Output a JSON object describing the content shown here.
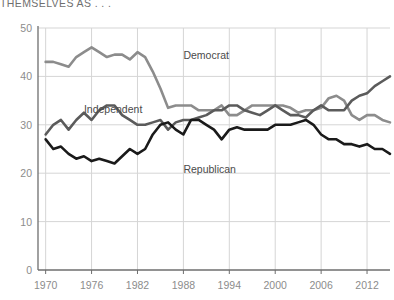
{
  "headline": {
    "text": "THEMSELVES AS . . ."
  },
  "colors": {
    "democrat": "#8c8c8c",
    "independent": "#5b5b5b",
    "republican": "#1a1a1a",
    "grid": "#d5d5d5",
    "axis": "#6e6e6e",
    "tick_text": "#8c8c8c",
    "label_text": "#4a4a4a",
    "headline_text": "#6f6f6f",
    "background": "#ffffff"
  },
  "chart_data": {
    "type": "line",
    "title": "THEMSELVES AS . . .",
    "xlabel": "",
    "ylabel": "",
    "xlim": [
      1969,
      2015
    ],
    "ylim": [
      0,
      50
    ],
    "ytick_values": [
      0,
      10,
      20,
      30,
      40,
      50
    ],
    "xtick_values": [
      1970,
      1976,
      1982,
      1988,
      1994,
      2000,
      2006,
      2012
    ],
    "grid": true,
    "legend_position": "inline-annotations",
    "annotations": [
      {
        "text": "Democrat",
        "x": 1988,
        "y": 43.5
      },
      {
        "text": "Independent",
        "x": 1975,
        "y": 32.5
      },
      {
        "text": "Republican",
        "x": 1988,
        "y": 20.0
      }
    ],
    "x": [
      1970,
      1971,
      1972,
      1973,
      1974,
      1975,
      1976,
      1977,
      1978,
      1979,
      1980,
      1981,
      1982,
      1983,
      1984,
      1985,
      1986,
      1987,
      1988,
      1989,
      1990,
      1991,
      1992,
      1993,
      1994,
      1995,
      1996,
      1997,
      1998,
      1999,
      2000,
      2001,
      2002,
      2003,
      2004,
      2005,
      2006,
      2007,
      2008,
      2009,
      2010,
      2011,
      2012,
      2013,
      2014,
      2015
    ],
    "series": [
      {
        "name": "Democrat",
        "color": "#8c8c8c",
        "values": [
          43,
          43,
          42.5,
          42,
          44,
          45,
          46,
          45,
          44,
          44.5,
          44.5,
          43.5,
          45,
          44,
          41,
          37.5,
          33.5,
          34,
          34,
          34,
          33,
          33,
          33,
          34,
          32,
          32,
          33,
          34,
          34,
          34,
          34,
          34,
          33.5,
          32.5,
          33,
          33,
          33.5,
          35.5,
          36,
          35,
          32,
          31,
          32,
          32,
          31,
          30.5
        ]
      },
      {
        "name": "Independent",
        "color": "#5b5b5b",
        "values": [
          28,
          30,
          31,
          29,
          31,
          32.5,
          31,
          33,
          34,
          34,
          32,
          31,
          30,
          30,
          30.5,
          31,
          29,
          30.5,
          31,
          31,
          31.5,
          32,
          33,
          33,
          34,
          34,
          33,
          32.5,
          32,
          33,
          34,
          33,
          32,
          32,
          31.5,
          33,
          34,
          33,
          33,
          33,
          35,
          36,
          36.5,
          38,
          39,
          40
        ]
      },
      {
        "name": "Republican",
        "color": "#1a1a1a",
        "values": [
          27,
          25,
          25.5,
          24,
          23,
          23.5,
          22.5,
          23,
          22.5,
          22,
          23.5,
          25,
          24,
          25,
          28,
          30,
          30.5,
          29,
          28,
          31,
          31,
          30,
          29,
          27,
          29,
          29.5,
          29,
          29,
          29,
          29,
          30,
          30,
          30,
          30.5,
          31,
          30,
          28,
          27,
          27,
          26,
          26,
          25.5,
          26,
          25,
          25,
          24
        ]
      }
    ]
  }
}
